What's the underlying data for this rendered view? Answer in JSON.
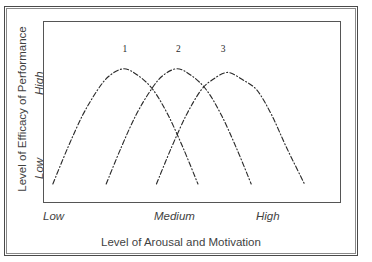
{
  "figure": {
    "axis_title_y": "Level of Efficacy of Performance",
    "axis_title_x": "Level of Arousal and Motivation"
  },
  "ticks": {
    "y_high": "High",
    "y_low": "Low",
    "x_low": "Low",
    "x_medium": "Medium",
    "x_high": "High"
  },
  "curve_labels": {
    "one": "1",
    "two": "2",
    "three": "3"
  },
  "colors": {
    "line": "#2b2b2b",
    "frame": "#555555",
    "outer_frame": "#4a4a4a",
    "text": "#3f3f3f"
  },
  "chart_data": {
    "type": "line",
    "title": "",
    "xlabel": "Level of Arousal and Motivation",
    "ylabel": "Level of Efficacy of Performance",
    "xlim": [
      0,
      100
    ],
    "ylim": [
      0,
      100
    ],
    "x_tick_labels": [
      "Low",
      "Medium",
      "High"
    ],
    "x_tick_values": [
      5,
      50,
      92
    ],
    "y_tick_labels": [
      "Low",
      "High"
    ],
    "y_tick_values": [
      18,
      72
    ],
    "grid": false,
    "legend": "none",
    "annotations": [
      {
        "text": "1",
        "x": 27,
        "y": 84
      },
      {
        "text": "2",
        "x": 45,
        "y": 84
      },
      {
        "text": "3",
        "x": 60,
        "y": 84
      }
    ],
    "series": [
      {
        "name": "1",
        "style": "dash-dot",
        "peak_x": 27,
        "peak_y": 74,
        "x": [
          3,
          8,
          13,
          18,
          22,
          27,
          32,
          37,
          42,
          47,
          52
        ],
        "y": [
          10,
          30,
          48,
          62,
          70,
          74,
          70,
          62,
          48,
          30,
          10
        ]
      },
      {
        "name": "2",
        "style": "dash-dot",
        "peak_x": 45,
        "peak_y": 74,
        "x": [
          21,
          26,
          31,
          36,
          40,
          45,
          50,
          55,
          60,
          65,
          70
        ],
        "y": [
          10,
          30,
          48,
          62,
          70,
          74,
          70,
          62,
          48,
          30,
          10
        ]
      },
      {
        "name": "3",
        "style": "dash-dot",
        "peak_x": 62,
        "peak_y": 72,
        "x": [
          38,
          43,
          48,
          53,
          57,
          62,
          67,
          72,
          77,
          82,
          88
        ],
        "y": [
          10,
          30,
          48,
          62,
          68,
          72,
          68,
          62,
          48,
          30,
          10
        ]
      }
    ]
  }
}
